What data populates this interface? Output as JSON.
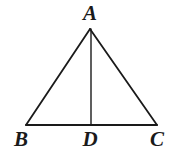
{
  "figure": {
    "kind": "geometry-diagram",
    "background_color": "#ffffff",
    "stroke_color": "#1a1a1a",
    "label_color": "#1a1a1a"
  },
  "labels": {
    "apex": "A",
    "base_left": "B",
    "base_mid": "D",
    "base_right": "C"
  },
  "geometry": {
    "points": {
      "A": {
        "x": 90,
        "y": 29
      },
      "B": {
        "x": 26,
        "y": 125
      },
      "C": {
        "x": 157,
        "y": 125
      },
      "D": {
        "x": 91,
        "y": 125
      }
    },
    "segments": [
      {
        "name": "AB",
        "from": "A",
        "to": "B",
        "stroke_width": 1.8
      },
      {
        "name": "AC",
        "from": "A",
        "to": "C",
        "stroke_width": 1.8
      },
      {
        "name": "BC",
        "from": "B",
        "to": "C",
        "stroke_width": 1.8
      },
      {
        "name": "AD",
        "from": "A",
        "to": "D",
        "stroke_width": 1.4
      }
    ]
  }
}
